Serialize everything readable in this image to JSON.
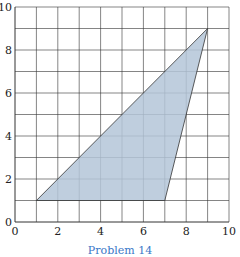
{
  "chart_data": {
    "type": "area",
    "title": "",
    "xlabel": "",
    "ylabel": "",
    "xlim": [
      0,
      10
    ],
    "ylim": [
      0,
      10
    ],
    "grid": true,
    "grid_step": 1,
    "x_ticks": [
      "0",
      "2",
      "4",
      "6",
      "8",
      "10"
    ],
    "y_ticks": [
      "0",
      "2",
      "4",
      "6",
      "8",
      "10"
    ],
    "series": [
      {
        "name": "triangle",
        "shape": "polygon",
        "points": [
          [
            1,
            1
          ],
          [
            7,
            1
          ],
          [
            9,
            9
          ]
        ],
        "fill": "#b4c5d8",
        "stroke": "#333333"
      }
    ],
    "caption": "Problem 14"
  },
  "colors": {
    "grid": "#333333",
    "fill": "#b4c5d8",
    "caption": "#3a78c8"
  }
}
